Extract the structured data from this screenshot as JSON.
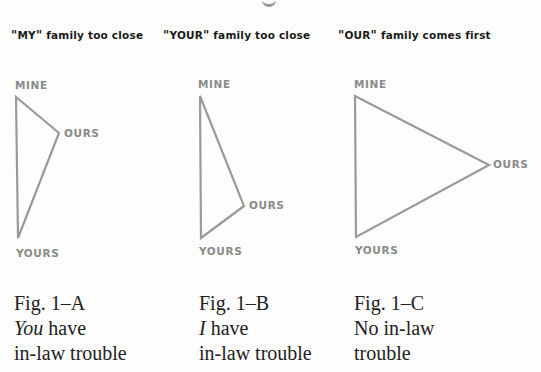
{
  "top_fragment": "g",
  "figures": [
    {
      "id": "A",
      "heading": "\"MY\" family too close",
      "heading_parts": {
        "open_quote": "\"",
        "word": "MY",
        "close_quote": "\"",
        "rest": " family too close"
      },
      "vertices": {
        "MINE": {
          "x": 16,
          "y": 97
        },
        "OURS": {
          "x": 59,
          "y": 133
        },
        "YOURS": {
          "x": 18,
          "y": 238
        }
      },
      "labels": {
        "mine": "MINE",
        "ours": "OURS",
        "yours": "YOURS"
      },
      "caption": {
        "fig": "Fig. 1–A",
        "line2_emph": "You",
        "line2_rest": " have",
        "line3": "in-law trouble"
      }
    },
    {
      "id": "B",
      "heading": "\"YOUR\" family too close",
      "heading_parts": {
        "open_quote": "\"",
        "word": "YOUR",
        "close_quote": "\"",
        "rest": " family too close"
      },
      "vertices": {
        "MINE": {
          "x": 200,
          "y": 96
        },
        "OURS": {
          "x": 244,
          "y": 206
        },
        "YOURS": {
          "x": 201,
          "y": 238
        }
      },
      "labels": {
        "mine": "MINE",
        "ours": "OURS",
        "yours": "YOURS"
      },
      "caption": {
        "fig": "Fig. 1–B",
        "line2_emph": "I",
        "line2_rest": " have",
        "line3": "in-law trouble"
      }
    },
    {
      "id": "C",
      "heading": "\"OUR\" family comes first",
      "heading_parts": {
        "open_quote": "\"",
        "word": "OUR",
        "close_quote": "\"",
        "rest": " family comes first"
      },
      "vertices": {
        "MINE": {
          "x": 355,
          "y": 96
        },
        "OURS": {
          "x": 489,
          "y": 165
        },
        "YOURS": {
          "x": 356,
          "y": 237
        }
      },
      "labels": {
        "mine": "MINE",
        "ours": "OURS",
        "yours": "YOURS"
      },
      "caption": {
        "fig": "Fig. 1–C",
        "line2_emph": "",
        "line2_rest": "No in-law",
        "line3": "trouble"
      }
    }
  ],
  "colors": {
    "triangle_stroke": "#9a9a9a",
    "vertex_label": "#8a8a8a",
    "heading_text": "#1a1a1a",
    "caption_text": "#222222",
    "background": "#fdfdfd"
  }
}
